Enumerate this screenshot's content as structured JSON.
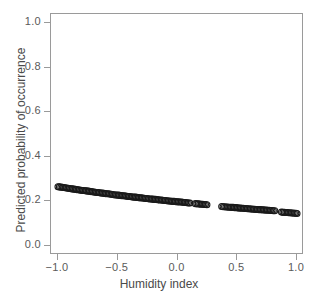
{
  "chart_data": {
    "type": "scatter",
    "title": "",
    "xlabel": "Humidity index",
    "ylabel": "Predicted probability of occurrence",
    "xlim": [
      -1.0,
      1.0
    ],
    "ylim": [
      0.0,
      1.0
    ],
    "grid": false,
    "legend": null,
    "marker": {
      "shape": "open-circle",
      "size": 3.0,
      "edge_color": "#1a1a1a",
      "face_color": "none"
    },
    "series": [
      {
        "name": "Predicted probability",
        "x": [
          -1.0,
          -0.988,
          -0.976,
          -0.964,
          -0.952,
          -0.94,
          -0.928,
          -0.916,
          -0.904,
          -0.892,
          -0.88,
          -0.868,
          -0.856,
          -0.844,
          -0.832,
          -0.82,
          -0.808,
          -0.796,
          -0.784,
          -0.772,
          -0.76,
          -0.748,
          -0.736,
          -0.724,
          -0.712,
          -0.7,
          -0.688,
          -0.676,
          -0.664,
          -0.652,
          -0.64,
          -0.628,
          -0.616,
          -0.604,
          -0.592,
          -0.58,
          -0.568,
          -0.556,
          -0.544,
          -0.532,
          -0.52,
          -0.508,
          -0.496,
          -0.484,
          -0.472,
          -0.46,
          -0.448,
          -0.436,
          -0.424,
          -0.412,
          -0.4,
          -0.388,
          -0.376,
          -0.364,
          -0.352,
          -0.34,
          -0.328,
          -0.316,
          -0.304,
          -0.292,
          -0.28,
          -0.268,
          -0.256,
          -0.244,
          -0.232,
          -0.22,
          -0.208,
          -0.196,
          -0.184,
          -0.172,
          -0.16,
          -0.148,
          -0.136,
          -0.124,
          -0.112,
          -0.1,
          -0.088,
          -0.076,
          -0.064,
          -0.052,
          -0.04,
          -0.028,
          -0.016,
          -0.004,
          0.008,
          0.02,
          0.032,
          0.044,
          0.056,
          0.068,
          0.08,
          0.092,
          0.104,
          0.15,
          0.162,
          0.174,
          0.186,
          0.198,
          0.21,
          0.222,
          0.234,
          0.246,
          0.37,
          0.382,
          0.394,
          0.406,
          0.418,
          0.43,
          0.442,
          0.454,
          0.466,
          0.478,
          0.49,
          0.502,
          0.514,
          0.526,
          0.538,
          0.55,
          0.562,
          0.574,
          0.586,
          0.598,
          0.61,
          0.622,
          0.634,
          0.646,
          0.658,
          0.67,
          0.682,
          0.694,
          0.706,
          0.718,
          0.73,
          0.742,
          0.754,
          0.766,
          0.778,
          0.79,
          0.802,
          0.814,
          0.87,
          0.882,
          0.894,
          0.906,
          0.918,
          0.93,
          0.942,
          0.954,
          0.966,
          0.978,
          0.99,
          1.0
        ],
        "y": [
          0.266,
          0.265,
          0.264,
          0.263,
          0.262,
          0.261,
          0.26,
          0.259,
          0.258,
          0.257,
          0.256,
          0.255,
          0.254,
          0.253,
          0.252,
          0.251,
          0.25,
          0.249,
          0.249,
          0.248,
          0.247,
          0.246,
          0.245,
          0.244,
          0.243,
          0.242,
          0.241,
          0.24,
          0.24,
          0.239,
          0.238,
          0.237,
          0.236,
          0.235,
          0.234,
          0.234,
          0.233,
          0.232,
          0.231,
          0.23,
          0.229,
          0.229,
          0.228,
          0.227,
          0.226,
          0.225,
          0.225,
          0.224,
          0.223,
          0.222,
          0.222,
          0.221,
          0.22,
          0.219,
          0.219,
          0.218,
          0.217,
          0.216,
          0.216,
          0.215,
          0.214,
          0.213,
          0.213,
          0.212,
          0.211,
          0.211,
          0.21,
          0.209,
          0.209,
          0.208,
          0.207,
          0.206,
          0.206,
          0.205,
          0.204,
          0.204,
          0.203,
          0.202,
          0.202,
          0.201,
          0.2,
          0.2,
          0.199,
          0.198,
          0.198,
          0.197,
          0.197,
          0.196,
          0.195,
          0.195,
          0.194,
          0.193,
          0.193,
          0.19,
          0.189,
          0.189,
          0.188,
          0.187,
          0.187,
          0.186,
          0.186,
          0.185,
          0.177,
          0.176,
          0.176,
          0.175,
          0.175,
          0.174,
          0.174,
          0.173,
          0.173,
          0.172,
          0.172,
          0.171,
          0.17,
          0.17,
          0.169,
          0.169,
          0.168,
          0.168,
          0.167,
          0.167,
          0.166,
          0.166,
          0.165,
          0.165,
          0.164,
          0.164,
          0.163,
          0.163,
          0.162,
          0.162,
          0.161,
          0.161,
          0.16,
          0.16,
          0.159,
          0.159,
          0.158,
          0.158,
          0.152,
          0.151,
          0.151,
          0.15,
          0.15,
          0.149,
          0.149,
          0.148,
          0.148,
          0.147,
          0.147,
          0.146
        ]
      }
    ]
  },
  "axes": {
    "x": {
      "label": "Humidity index",
      "ticks": [
        {
          "value": -1.0,
          "text": "−1.0"
        },
        {
          "value": -0.5,
          "text": "−0.5"
        },
        {
          "value": 0.0,
          "text": "0.0"
        },
        {
          "value": 0.5,
          "text": "0.5"
        },
        {
          "value": 1.0,
          "text": "1.0"
        }
      ]
    },
    "y": {
      "label": "Predicted probability of occurrence",
      "ticks": [
        {
          "value": 0.0,
          "text": "0.0"
        },
        {
          "value": 0.2,
          "text": "0.2"
        },
        {
          "value": 0.4,
          "text": "0.4"
        },
        {
          "value": 0.6,
          "text": "0.6"
        },
        {
          "value": 0.8,
          "text": "0.8"
        },
        {
          "value": 1.0,
          "text": "1.0"
        }
      ]
    }
  },
  "style": {
    "background": "#ffffff",
    "panel_border": "#9a9a9a",
    "tick_color": "#9a9a9a",
    "tick_label_color": "#5a5a5a",
    "axis_title_color": "#4a4a4a",
    "marker_color": "#1a1a1a"
  }
}
